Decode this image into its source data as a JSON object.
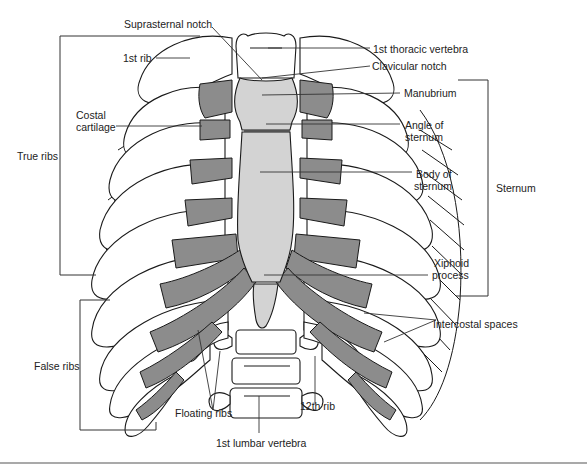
{
  "figure": {
    "colors": {
      "bone": "#ffffff",
      "outline": "#1a1a1a",
      "cartilage": "#8c8c8c",
      "sternum": "#d3d3d3",
      "leader_line": "#333333",
      "bottom_rule": "#555555"
    },
    "labels": {
      "suprasternal_notch": "Suprasternal notch",
      "first_rib": "1st rib",
      "first_thoracic_vertebra": "1st thoracic vertebra",
      "clavicular_notch": "Clavicular notch",
      "manubrium": "Manubrium",
      "costal_cartilage_l1": "Costal",
      "costal_cartilage_l2": "cartilage",
      "angle_of_sternum_l1": "Angle of",
      "angle_of_sternum_l2": "sternum",
      "true_ribs": "True ribs",
      "body_of_sternum_l1": "Body of",
      "body_of_sternum_l2": "sternum",
      "sternum": "Sternum",
      "xiphoid_process_l1": "Xiphoid",
      "xiphoid_process_l2": "process",
      "intercostal_spaces": "Intercostal spaces",
      "false_ribs": "False ribs",
      "floating_ribs": "Floating ribs",
      "twelfth_rib": "12th rib",
      "first_lumbar_vertebra": "1st lumbar vertebra"
    },
    "brackets": {
      "true_ribs": "ribs 1–7",
      "false_ribs": "ribs 8–12",
      "sternum": "manubrium to xiphoid"
    }
  }
}
